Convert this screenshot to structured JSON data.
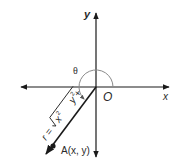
{
  "diagram": {
    "type": "polar-coordinates",
    "labels": {
      "x_axis": "x",
      "y_axis": "y",
      "origin": "O",
      "angle": "θ",
      "point": "A(x, y)",
      "radius_prefix": "r = ",
      "radius_x": "x",
      "radius_plus": " + ",
      "radius_y": "y",
      "radius_exp": "2"
    },
    "colors": {
      "axis": "#1a1a1a",
      "arc": "#8a8a8a",
      "ray": "#1a1a1a",
      "text": "#2a2a2a"
    },
    "geometry": {
      "origin": [
        96,
        87
      ],
      "arc_radius": 17,
      "angle_degrees": 225,
      "point_A": [
        53,
        146
      ]
    }
  }
}
